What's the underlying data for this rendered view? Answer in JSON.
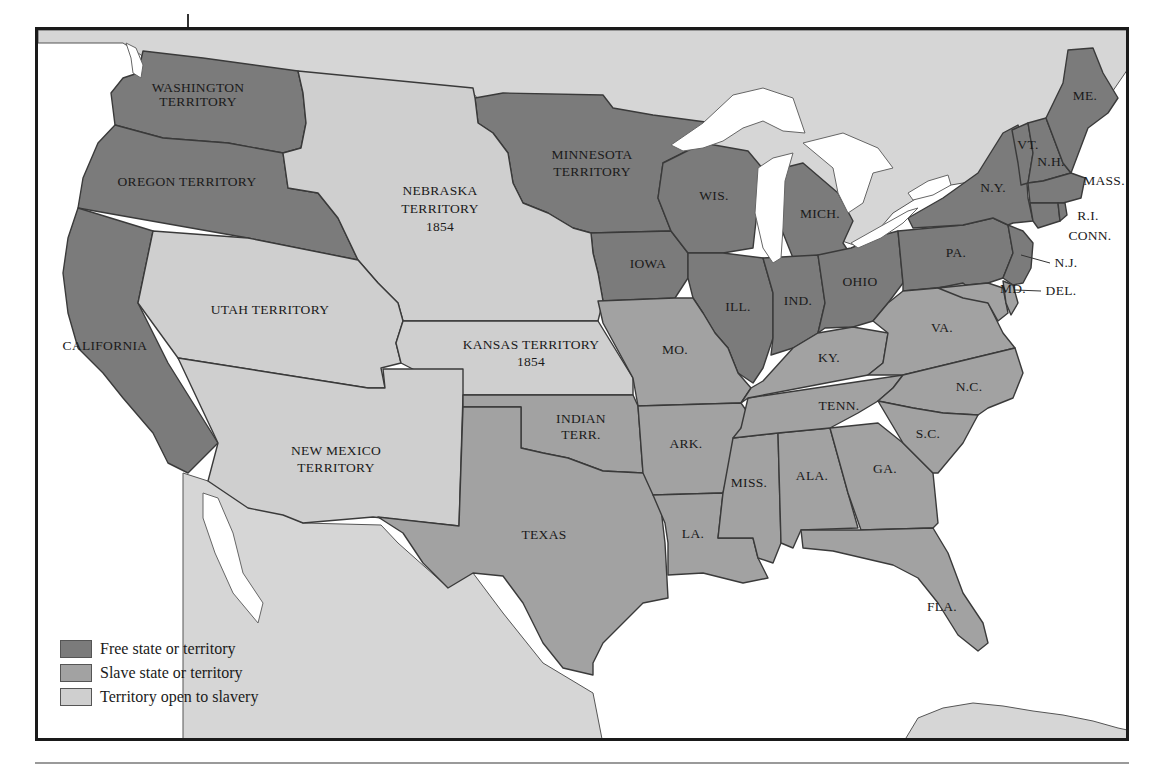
{
  "colors": {
    "free": "#7b7b7b",
    "slave": "#a2a2a2",
    "open": "#cfcfcf",
    "water": "#ffffff",
    "frame": "#1a1a1a"
  },
  "legend": [
    {
      "key": "free",
      "label": "Free state or territory"
    },
    {
      "key": "slave",
      "label": "Slave state or territory"
    },
    {
      "key": "open",
      "label": "Territory open to slavery"
    }
  ],
  "regions": {
    "washington": {
      "name": "WASHINGTON",
      "sub": "TERRITORY",
      "status": "free"
    },
    "oregon": {
      "name": "OREGON TERRITORY",
      "status": "free"
    },
    "california": {
      "name": "CALIFORNIA",
      "status": "free"
    },
    "nebraska": {
      "name": "NEBRASKA",
      "sub": "TERRITORY",
      "year": "1854",
      "status": "open"
    },
    "utah": {
      "name": "UTAH TERRITORY",
      "status": "open"
    },
    "kansas": {
      "name": "KANSAS TERRITORY",
      "year": "1854",
      "status": "open"
    },
    "new_mexico": {
      "name": "NEW MEXICO",
      "sub": "TERRITORY",
      "status": "open"
    },
    "minnesota": {
      "name": "MINNESOTA",
      "sub": "TERRITORY",
      "status": "free"
    },
    "iowa": {
      "name": "IOWA",
      "status": "free"
    },
    "wisconsin": {
      "name": "WIS.",
      "status": "free"
    },
    "michigan": {
      "name": "MICH.",
      "status": "free"
    },
    "illinois": {
      "name": "ILL.",
      "status": "free"
    },
    "indiana": {
      "name": "IND.",
      "status": "free"
    },
    "ohio": {
      "name": "OHIO",
      "status": "free"
    },
    "pennsylvania": {
      "name": "PA.",
      "status": "free"
    },
    "new_york": {
      "name": "N.Y.",
      "status": "free"
    },
    "vermont": {
      "name": "VT.",
      "status": "free"
    },
    "new_hampshire": {
      "name": "N.H.",
      "status": "free"
    },
    "maine": {
      "name": "ME.",
      "status": "free"
    },
    "massachusetts": {
      "name": "MASS.",
      "status": "free"
    },
    "rhode_island": {
      "name": "R.I.",
      "status": "free"
    },
    "connecticut": {
      "name": "CONN.",
      "status": "free"
    },
    "new_jersey": {
      "name": "N.J.",
      "status": "free"
    },
    "maryland": {
      "name": "MD.",
      "status": "slave"
    },
    "delaware": {
      "name": "DEL.",
      "status": "slave"
    },
    "virginia": {
      "name": "VA.",
      "status": "slave"
    },
    "kentucky": {
      "name": "KY.",
      "status": "slave"
    },
    "missouri": {
      "name": "MO.",
      "status": "slave"
    },
    "indian_territory": {
      "name": "INDIAN",
      "sub": "TERR.",
      "status": "slave"
    },
    "texas": {
      "name": "TEXAS",
      "status": "slave"
    },
    "arkansas": {
      "name": "ARK.",
      "status": "slave"
    },
    "louisiana": {
      "name": "LA.",
      "status": "slave"
    },
    "tennessee": {
      "name": "TENN.",
      "status": "slave"
    },
    "north_carolina": {
      "name": "N.C.",
      "status": "slave"
    },
    "south_carolina": {
      "name": "S.C.",
      "status": "slave"
    },
    "georgia": {
      "name": "GA.",
      "status": "slave"
    },
    "alabama": {
      "name": "ALA.",
      "status": "slave"
    },
    "mississippi": {
      "name": "MISS.",
      "status": "slave"
    },
    "florida": {
      "name": "FLA.",
      "status": "slave"
    }
  }
}
